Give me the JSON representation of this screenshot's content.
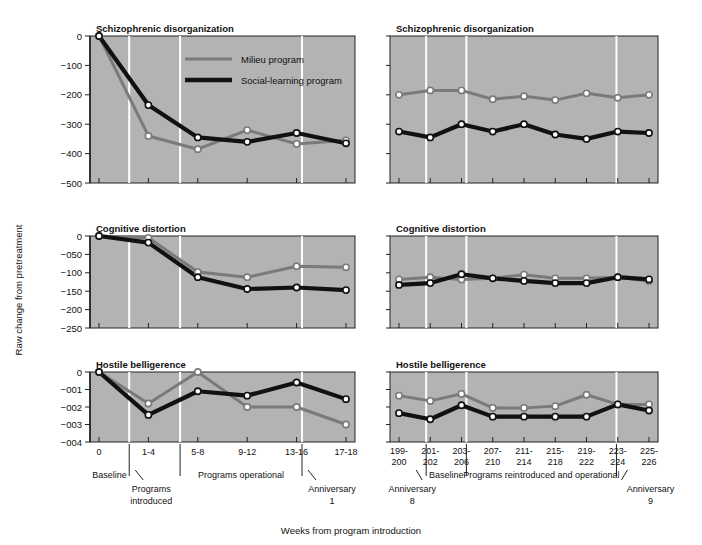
{
  "figure": {
    "y_axis_label": "Raw change from pretreatment",
    "x_caption": "Weeks from program introduction",
    "panel_bg": "#b3b3b3",
    "milieu_color": "#7a7a7a",
    "social_color": "#111111",
    "marker_fill": "#ffffff",
    "separator_color": "#ffffff"
  },
  "legend": {
    "position": "top-left-panel-inside",
    "entries": [
      {
        "label": "Milieu program",
        "color": "#7a7a7a",
        "width": 3
      },
      {
        "label": "Social-learning program",
        "color": "#111111",
        "width": 4.5
      }
    ]
  },
  "annotations": {
    "left": [
      {
        "text": "Baseline"
      },
      {
        "text": "Programs",
        "text2": "introduced"
      },
      {
        "text": "Programs operational"
      },
      {
        "text": "Anniversary",
        "text2": "1"
      }
    ],
    "right": [
      {
        "text": "Anniversary",
        "text2": "8"
      },
      {
        "text": "Baseline"
      },
      {
        "text": "Programs reintroduced and operational"
      },
      {
        "text": "Anniversary",
        "text2": "9"
      }
    ]
  },
  "chart_data": [
    {
      "id": "schizophrenic-left",
      "type": "line",
      "title": "Schizophrenic disorganization",
      "panel": "top-left",
      "xlabel": "Weeks from program introduction",
      "ylabel": "Raw change from pretreatment",
      "categories": [
        "0",
        "1-4",
        "5-8",
        "9-12",
        "13-16",
        "17-18"
      ],
      "yticks": [
        "0",
        "-100",
        "-200",
        "-300",
        "-400",
        "-500"
      ],
      "ylim": [
        -500,
        0
      ],
      "grid": false,
      "series": [
        {
          "name": "Milieu program",
          "color": "#7a7a7a",
          "values": [
            0,
            -340,
            -385,
            -320,
            -367,
            -355
          ]
        },
        {
          "name": "Social-learning program",
          "color": "#111111",
          "values": [
            0,
            -235,
            -345,
            -360,
            -330,
            -365
          ]
        }
      ]
    },
    {
      "id": "schizophrenic-right",
      "type": "line",
      "title": "Schizophrenic disorganization",
      "panel": "top-right",
      "categories": [
        "199-200",
        "201-202",
        "203-206",
        "207-210",
        "211-214",
        "215-218",
        "219-222",
        "223-224",
        "225-226"
      ],
      "ylim": [
        -500,
        0
      ],
      "grid": false,
      "series": [
        {
          "name": "Milieu program",
          "color": "#7a7a7a",
          "values": [
            -200,
            -185,
            -185,
            -215,
            -205,
            -218,
            -195,
            -210,
            -200
          ]
        },
        {
          "name": "Social-learning program",
          "color": "#111111",
          "values": [
            -325,
            -345,
            -300,
            -325,
            -300,
            -335,
            -350,
            -325,
            -330
          ]
        }
      ]
    },
    {
      "id": "cognitive-left",
      "type": "line",
      "title": "Cognitive distortion",
      "panel": "middle-left",
      "categories": [
        "0",
        "1-4",
        "5-8",
        "9-12",
        "13-16",
        "17-18"
      ],
      "yticks": [
        "0",
        "-050",
        "-100",
        "-150",
        "-200",
        "-250"
      ],
      "ylim": [
        -250,
        0
      ],
      "grid": false,
      "series": [
        {
          "name": "Milieu program",
          "color": "#7a7a7a",
          "values": [
            0,
            -5,
            -98,
            -112,
            -82,
            -85
          ]
        },
        {
          "name": "Social-learning program",
          "color": "#111111",
          "values": [
            0,
            -18,
            -112,
            -144,
            -140,
            -147
          ]
        }
      ]
    },
    {
      "id": "cognitive-right",
      "type": "line",
      "title": "Cognitive distortion",
      "panel": "middle-right",
      "categories": [
        "199-200",
        "201-202",
        "203-206",
        "207-210",
        "211-214",
        "215-218",
        "219-222",
        "223-224",
        "225-226"
      ],
      "ylim": [
        -250,
        0
      ],
      "grid": false,
      "series": [
        {
          "name": "Milieu program",
          "color": "#7a7a7a",
          "values": [
            -118,
            -112,
            -118,
            -115,
            -105,
            -115,
            -115,
            -112,
            -122
          ]
        },
        {
          "name": "Social-learning program",
          "color": "#111111",
          "values": [
            -133,
            -128,
            -104,
            -115,
            -122,
            -128,
            -128,
            -112,
            -118
          ]
        }
      ]
    },
    {
      "id": "hostile-left",
      "type": "line",
      "title": "Hostile belligerence",
      "panel": "bottom-left",
      "categories": [
        "0",
        "1-4",
        "5-8",
        "9-12",
        "13-16",
        "17-18"
      ],
      "yticks": [
        "0",
        "-001",
        "-002",
        "-003",
        "-004"
      ],
      "ylim": [
        -4,
        0
      ],
      "grid": false,
      "series": [
        {
          "name": "Milieu program",
          "color": "#7a7a7a",
          "values": [
            0,
            -1.8,
            0,
            -2.0,
            -2.0,
            -3.0
          ]
        },
        {
          "name": "Social-learning program",
          "color": "#111111",
          "values": [
            0,
            -2.45,
            -1.1,
            -1.35,
            -0.6,
            -1.55
          ]
        }
      ]
    },
    {
      "id": "hostile-right",
      "type": "line",
      "title": "Hostile belligerence",
      "panel": "bottom-right",
      "categories": [
        "199-200",
        "201-202",
        "203-206",
        "207-210",
        "211-214",
        "215-218",
        "219-222",
        "223-224",
        "225-226"
      ],
      "ylim": [
        -4,
        0
      ],
      "grid": false,
      "series": [
        {
          "name": "Milieu program",
          "color": "#7a7a7a",
          "values": [
            -1.35,
            -1.65,
            -1.25,
            -2.05,
            -2.05,
            -1.95,
            -1.3,
            -1.85,
            -1.85
          ]
        },
        {
          "name": "Social-learning program",
          "color": "#111111",
          "values": [
            -2.35,
            -2.7,
            -1.9,
            -2.55,
            -2.55,
            -2.55,
            -2.55,
            -1.85,
            -2.2
          ]
        }
      ]
    }
  ],
  "xticks_left": [
    "0",
    "1-4",
    "5-8",
    "9-12",
    "13-16",
    "17-18"
  ],
  "xticks_right": [
    {
      "l1": "199-",
      "l2": "200"
    },
    {
      "l1": "201-",
      "l2": "202"
    },
    {
      "l1": "203-",
      "l2": "206"
    },
    {
      "l1": "207-",
      "l2": "210"
    },
    {
      "l1": "211-",
      "l2": "214"
    },
    {
      "l1": "215-",
      "l2": "218"
    },
    {
      "l1": "219-",
      "l2": "222"
    },
    {
      "l1": "223-",
      "l2": "224"
    },
    {
      "l1": "225-",
      "l2": "226"
    }
  ]
}
